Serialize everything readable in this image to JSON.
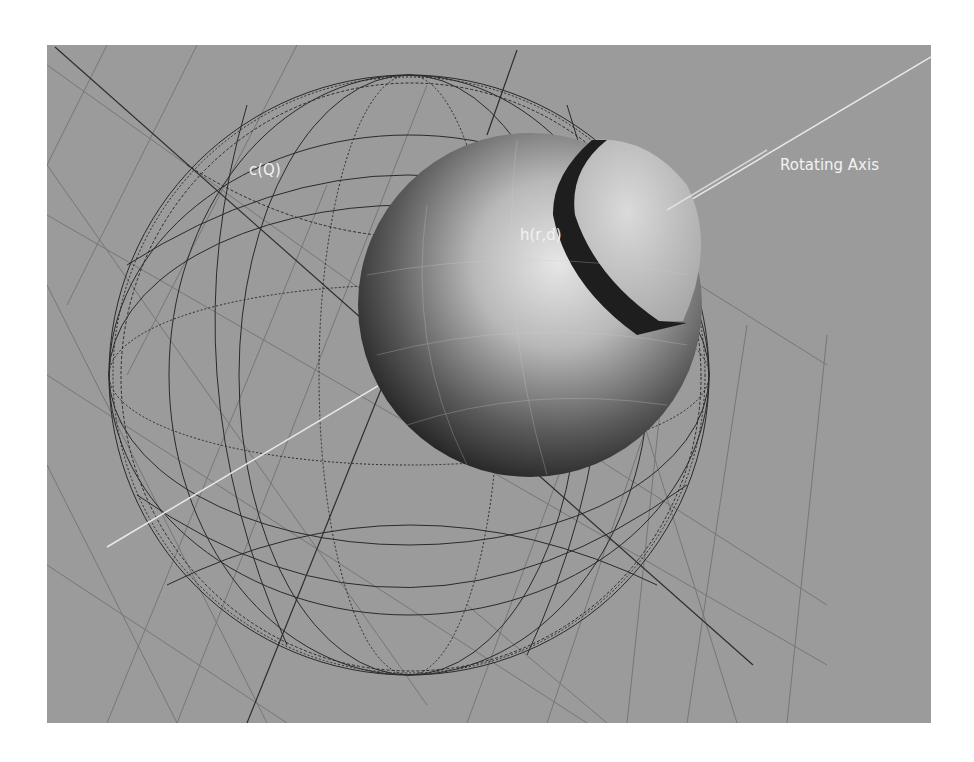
{
  "figure": {
    "background_color": "#9b9b9b",
    "wireframe_color": "#2a2a2a",
    "axis_color": "#e8e8e8",
    "labels": {
      "outer_sphere": "c(Q)",
      "inner_sphere": "h(r,d)",
      "axis": "Rotating Axis"
    },
    "objects": [
      {
        "name": "wireframe-sphere",
        "label": "c(Q)",
        "style": "wireframe"
      },
      {
        "name": "shaded-sphere",
        "label": "h(r,d)",
        "style": "solid-shaded"
      },
      {
        "name": "rotating-axis",
        "label": "Rotating Axis",
        "style": "line"
      },
      {
        "name": "ground-grid",
        "label": "",
        "style": "grid-plane"
      }
    ]
  }
}
